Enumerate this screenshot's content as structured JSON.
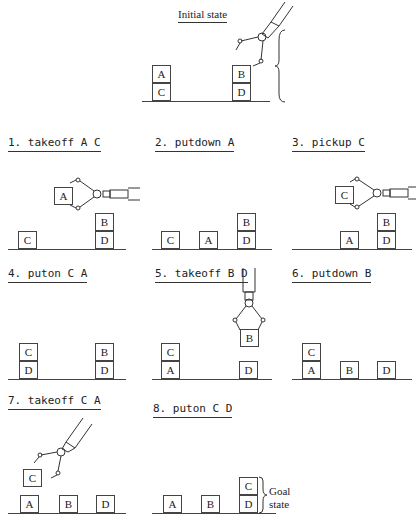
{
  "diagram": {
    "initial": {
      "title": "Initial state",
      "blocks": [
        "A",
        "C",
        "B",
        "D"
      ]
    },
    "steps": [
      {
        "label": "1. takeoff A C",
        "held": "A",
        "blocks": [
          "C",
          "B",
          "D"
        ]
      },
      {
        "label": "2. putdown A",
        "blocks": [
          "C",
          "A",
          "B",
          "D"
        ]
      },
      {
        "label": "3. pickup C",
        "held": "C",
        "blocks": [
          "A",
          "B",
          "D"
        ]
      },
      {
        "label": "4. puton C A",
        "blocks": [
          "C",
          "D",
          "B",
          "D"
        ]
      },
      {
        "label": "5. takeoff B D",
        "held": "B",
        "blocks": [
          "C",
          "A",
          "D"
        ]
      },
      {
        "label": "6. putdown B",
        "blocks": [
          "C",
          "A",
          "B",
          "D"
        ]
      },
      {
        "label": "7. takeoff C A",
        "held": "C",
        "blocks": [
          "A",
          "B",
          "D"
        ]
      },
      {
        "label": "8. puton C D",
        "blocks": [
          "A",
          "B",
          "C",
          "D"
        ]
      }
    ],
    "goal_label_line1": "Goal",
    "goal_label_line2": "state"
  }
}
